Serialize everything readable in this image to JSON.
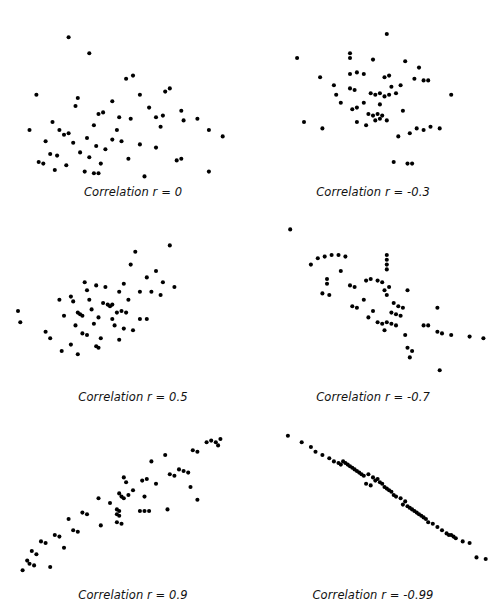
{
  "figure": {
    "title": "",
    "background_color": "#ffffff",
    "point_color": "#000000",
    "width": 499,
    "height": 613
  },
  "chart_data": [
    {
      "type": "scatter",
      "title": "Correlation r = 0",
      "r": 0,
      "xlabel": "",
      "ylabel": "",
      "xlim": [
        0,
        100
      ],
      "ylim": [
        0,
        100
      ],
      "grid": false,
      "legend": "none",
      "marker": "filled-circle",
      "n": 57,
      "points": [
        [
          22,
          88
        ],
        [
          31,
          78
        ],
        [
          47,
          62
        ],
        [
          50,
          64
        ],
        [
          8,
          52
        ],
        [
          26,
          50
        ],
        [
          41,
          48
        ],
        [
          64,
          54
        ],
        [
          66,
          56
        ],
        [
          57,
          44
        ],
        [
          71,
          42
        ],
        [
          35,
          40
        ],
        [
          37,
          41
        ],
        [
          44,
          38
        ],
        [
          49,
          37
        ],
        [
          60,
          38
        ],
        [
          63,
          39
        ],
        [
          72,
          36
        ],
        [
          78,
          37
        ],
        [
          33,
          33
        ],
        [
          62,
          32
        ],
        [
          83,
          30
        ],
        [
          5,
          30
        ],
        [
          18,
          30
        ],
        [
          20,
          27
        ],
        [
          22,
          28
        ],
        [
          30,
          25
        ],
        [
          12,
          23
        ],
        [
          24,
          22
        ],
        [
          41,
          24
        ],
        [
          45,
          23
        ],
        [
          34,
          20
        ],
        [
          53,
          21
        ],
        [
          38,
          18
        ],
        [
          60,
          19
        ],
        [
          14,
          15
        ],
        [
          17,
          14
        ],
        [
          27,
          16
        ],
        [
          31,
          13
        ],
        [
          48,
          12
        ],
        [
          9,
          10
        ],
        [
          11,
          9
        ],
        [
          21,
          8
        ],
        [
          36,
          9
        ],
        [
          69,
          11
        ],
        [
          71,
          12
        ],
        [
          16,
          5
        ],
        [
          29,
          4
        ],
        [
          33,
          3
        ],
        [
          35,
          3
        ],
        [
          55,
          1
        ],
        [
          83,
          4
        ],
        [
          89,
          26
        ],
        [
          15,
          35
        ],
        [
          25,
          45
        ],
        [
          53,
          52
        ],
        [
          43,
          30
        ]
      ]
    },
    {
      "type": "scatter",
      "title": "Correlation r = -0.3",
      "r": -0.3,
      "xlabel": "",
      "ylabel": "",
      "xlim": [
        0,
        100
      ],
      "ylim": [
        0,
        100
      ],
      "grid": false,
      "legend": "none",
      "marker": "filled-circle",
      "n": 55,
      "points": [
        [
          56,
          90
        ],
        [
          40,
          78
        ],
        [
          40,
          75
        ],
        [
          17,
          75
        ],
        [
          50,
          74
        ],
        [
          64,
          73
        ],
        [
          70,
          69
        ],
        [
          40,
          65
        ],
        [
          43,
          66
        ],
        [
          46,
          65
        ],
        [
          55,
          63
        ],
        [
          57,
          64
        ],
        [
          68,
          62
        ],
        [
          72,
          61
        ],
        [
          74,
          61
        ],
        [
          27,
          63
        ],
        [
          40,
          56
        ],
        [
          42,
          55
        ],
        [
          49,
          53
        ],
        [
          51,
          52
        ],
        [
          53,
          53
        ],
        [
          55,
          51
        ],
        [
          57,
          52
        ],
        [
          60,
          53
        ],
        [
          34,
          52
        ],
        [
          84,
          52
        ],
        [
          43,
          44
        ],
        [
          41,
          43
        ],
        [
          48,
          40
        ],
        [
          50,
          39
        ],
        [
          52,
          40
        ],
        [
          54,
          39
        ],
        [
          51,
          36
        ],
        [
          53,
          37
        ],
        [
          56,
          36
        ],
        [
          63,
          42
        ],
        [
          43,
          35
        ],
        [
          20,
          35
        ],
        [
          28,
          31
        ],
        [
          69,
          31
        ],
        [
          72,
          30
        ],
        [
          75,
          32
        ],
        [
          79,
          31
        ],
        [
          66,
          28
        ],
        [
          61,
          26
        ],
        [
          59,
          10
        ],
        [
          65,
          9
        ],
        [
          67,
          9
        ],
        [
          47,
          33
        ],
        [
          36,
          47
        ],
        [
          46,
          47
        ],
        [
          53,
          46
        ],
        [
          58,
          57
        ],
        [
          62,
          58
        ],
        [
          33,
          58
        ]
      ]
    },
    {
      "type": "scatter",
      "title": "Correlation r = 0.5",
      "r": 0.5,
      "xlabel": "",
      "ylabel": "",
      "xlim": [
        0,
        100
      ],
      "ylim": [
        0,
        100
      ],
      "grid": false,
      "legend": "none",
      "marker": "filled-circle",
      "n": 55,
      "points": [
        [
          66,
          86
        ],
        [
          51,
          82
        ],
        [
          49,
          74
        ],
        [
          60,
          70
        ],
        [
          56,
          66
        ],
        [
          63,
          63
        ],
        [
          46,
          62
        ],
        [
          34,
          61
        ],
        [
          38,
          60
        ],
        [
          30,
          58
        ],
        [
          53,
          57
        ],
        [
          58,
          57
        ],
        [
          62,
          55
        ],
        [
          18,
          52
        ],
        [
          24,
          51
        ],
        [
          37,
          50
        ],
        [
          39,
          49
        ],
        [
          40,
          48
        ],
        [
          41,
          49
        ],
        [
          26,
          44
        ],
        [
          27,
          43
        ],
        [
          28,
          42
        ],
        [
          20,
          42
        ],
        [
          32,
          46
        ],
        [
          35,
          41
        ],
        [
          41,
          40
        ],
        [
          53,
          40
        ],
        [
          56,
          40
        ],
        [
          33,
          37
        ],
        [
          42,
          36
        ],
        [
          46,
          34
        ],
        [
          50,
          33
        ],
        [
          12,
          32
        ],
        [
          28,
          31
        ],
        [
          30,
          30
        ],
        [
          14,
          28
        ],
        [
          44,
          27
        ],
        [
          23,
          24
        ],
        [
          34,
          23
        ],
        [
          35,
          22
        ],
        [
          19,
          20
        ],
        [
          26,
          18
        ],
        [
          0,
          45
        ],
        [
          1,
          38
        ],
        [
          68,
          60
        ],
        [
          45,
          45
        ],
        [
          47,
          44
        ],
        [
          43,
          44
        ],
        [
          31,
          52
        ],
        [
          44,
          57
        ],
        [
          29,
          63
        ],
        [
          23,
          54
        ],
        [
          36,
          28
        ],
        [
          25,
          36
        ],
        [
          48,
          52
        ]
      ]
    },
    {
      "type": "scatter",
      "title": "Correlation r = -0.7",
      "r": -0.7,
      "xlabel": "",
      "ylabel": "",
      "xlim": [
        0,
        100
      ],
      "ylim": [
        0,
        100
      ],
      "grid": false,
      "legend": "none",
      "marker": "filled-circle",
      "n": 56,
      "points": [
        [
          14,
          96
        ],
        [
          26,
          78
        ],
        [
          29,
          79
        ],
        [
          32,
          80
        ],
        [
          35,
          80
        ],
        [
          38,
          79
        ],
        [
          23,
          74
        ],
        [
          56,
          80
        ],
        [
          56,
          77
        ],
        [
          56,
          74
        ],
        [
          56,
          71
        ],
        [
          30,
          65
        ],
        [
          30,
          62
        ],
        [
          47,
          64
        ],
        [
          49,
          65
        ],
        [
          52,
          64
        ],
        [
          54,
          63
        ],
        [
          40,
          61
        ],
        [
          42,
          60
        ],
        [
          28,
          56
        ],
        [
          31,
          55
        ],
        [
          55,
          58
        ],
        [
          56,
          55
        ],
        [
          65,
          58
        ],
        [
          41,
          48
        ],
        [
          43,
          47
        ],
        [
          59,
          50
        ],
        [
          61,
          48
        ],
        [
          63,
          47
        ],
        [
          50,
          45
        ],
        [
          58,
          44
        ],
        [
          60,
          43
        ],
        [
          62,
          42
        ],
        [
          78,
          47
        ],
        [
          52,
          38
        ],
        [
          54,
          37
        ],
        [
          56,
          38
        ],
        [
          58,
          37
        ],
        [
          60,
          36
        ],
        [
          55,
          33
        ],
        [
          72,
          36
        ],
        [
          74,
          36
        ],
        [
          64,
          30
        ],
        [
          78,
          32
        ],
        [
          80,
          31
        ],
        [
          84,
          30
        ],
        [
          92,
          29
        ],
        [
          98,
          28
        ],
        [
          65,
          22
        ],
        [
          67,
          20
        ],
        [
          66,
          16
        ],
        [
          79,
          8
        ],
        [
          46,
          52
        ],
        [
          48,
          41
        ],
        [
          57,
          60
        ],
        [
          36,
          70
        ]
      ]
    },
    {
      "type": "scatter",
      "title": "Correlation r = 0.9",
      "r": 0.9,
      "xlabel": "",
      "ylabel": "",
      "xlim": [
        0,
        100
      ],
      "ylim": [
        0,
        100
      ],
      "grid": false,
      "legend": "none",
      "marker": "filled-circle",
      "n": 57,
      "points": [
        [
          82,
          88
        ],
        [
          84,
          89
        ],
        [
          86,
          88
        ],
        [
          87,
          86
        ],
        [
          88,
          90
        ],
        [
          76,
          83
        ],
        [
          78,
          82
        ],
        [
          64,
          80
        ],
        [
          58,
          76
        ],
        [
          70,
          71
        ],
        [
          72,
          70
        ],
        [
          74,
          69
        ],
        [
          66,
          68
        ],
        [
          68,
          67
        ],
        [
          46,
          66
        ],
        [
          47,
          63
        ],
        [
          54,
          64
        ],
        [
          56,
          65
        ],
        [
          60,
          62
        ],
        [
          75,
          60
        ],
        [
          44,
          56
        ],
        [
          45,
          54
        ],
        [
          46,
          53
        ],
        [
          48,
          55
        ],
        [
          55,
          54
        ],
        [
          35,
          53
        ],
        [
          78,
          52
        ],
        [
          43,
          46
        ],
        [
          44,
          45
        ],
        [
          43,
          43
        ],
        [
          44,
          42
        ],
        [
          53,
          45
        ],
        [
          55,
          45
        ],
        [
          57,
          45
        ],
        [
          65,
          46
        ],
        [
          28,
          44
        ],
        [
          30,
          43
        ],
        [
          22,
          40
        ],
        [
          43,
          38
        ],
        [
          45,
          37
        ],
        [
          36,
          36
        ],
        [
          24,
          33
        ],
        [
          26,
          32
        ],
        [
          16,
          30
        ],
        [
          18,
          29
        ],
        [
          10,
          26
        ],
        [
          12,
          25
        ],
        [
          20,
          22
        ],
        [
          6,
          20
        ],
        [
          8,
          18
        ],
        [
          4,
          14
        ],
        [
          5,
          12
        ],
        [
          7,
          11
        ],
        [
          14,
          10
        ],
        [
          2,
          8
        ],
        [
          40,
          50
        ],
        [
          50,
          58
        ]
      ]
    },
    {
      "type": "scatter",
      "title": "Correlation r = -0.99",
      "r": -0.99,
      "xlabel": "",
      "ylabel": "",
      "xlim": [
        0,
        100
      ],
      "ylim": [
        0,
        100
      ],
      "grid": false,
      "legend": "none",
      "marker": "filled-circle",
      "n": 58,
      "points": [
        [
          13,
          92
        ],
        [
          19,
          88
        ],
        [
          23,
          85
        ],
        [
          25,
          82
        ],
        [
          28,
          80
        ],
        [
          31,
          78
        ],
        [
          33,
          76
        ],
        [
          35,
          75
        ],
        [
          36,
          74
        ],
        [
          37,
          76
        ],
        [
          38,
          75
        ],
        [
          39,
          74
        ],
        [
          40,
          73
        ],
        [
          41,
          72
        ],
        [
          42,
          71
        ],
        [
          43,
          70
        ],
        [
          44,
          69
        ],
        [
          45,
          68
        ],
        [
          46,
          67
        ],
        [
          48,
          68
        ],
        [
          50,
          66
        ],
        [
          51,
          64
        ],
        [
          52,
          65
        ],
        [
          53,
          63
        ],
        [
          54,
          62
        ],
        [
          49,
          61
        ],
        [
          47,
          62
        ],
        [
          55,
          60
        ],
        [
          56,
          59
        ],
        [
          57,
          58
        ],
        [
          58,
          57
        ],
        [
          59,
          55
        ],
        [
          60,
          54
        ],
        [
          62,
          53
        ],
        [
          64,
          51
        ],
        [
          63,
          49
        ],
        [
          65,
          48
        ],
        [
          66,
          47
        ],
        [
          67,
          46
        ],
        [
          68,
          45
        ],
        [
          69,
          44
        ],
        [
          70,
          43
        ],
        [
          71,
          42
        ],
        [
          72,
          41
        ],
        [
          73,
          40
        ],
        [
          74,
          38
        ],
        [
          76,
          37
        ],
        [
          78,
          35
        ],
        [
          80,
          33
        ],
        [
          82,
          31
        ],
        [
          83,
          30
        ],
        [
          84,
          30
        ],
        [
          85,
          29
        ],
        [
          86,
          28
        ],
        [
          89,
          26
        ],
        [
          92,
          25
        ],
        [
          95,
          16
        ],
        [
          99,
          15
        ]
      ]
    }
  ]
}
